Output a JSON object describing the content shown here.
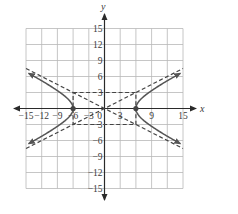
{
  "chart_data": {
    "type": "line",
    "title": "",
    "xlabel": "x",
    "ylabel": "y",
    "xlim": [
      -15,
      15
    ],
    "ylim": [
      -15,
      15
    ],
    "grid": true,
    "grid_step": 3,
    "x_tick_labels": [
      "-15",
      "-12",
      "-9",
      "-6",
      "-3",
      "0",
      "3",
      "6",
      "9",
      "15"
    ],
    "y_tick_labels": [
      "15",
      "12",
      "9",
      "6",
      "3",
      "-3",
      "-6",
      "-9",
      "-12",
      "-15"
    ],
    "equation": "x^2/36 - y^2/9 = 1",
    "series": [
      {
        "name": "hyperbola-right-branch",
        "style": "solid",
        "vertex": [
          6,
          0
        ],
        "arrows": true
      },
      {
        "name": "hyperbola-left-branch",
        "style": "solid",
        "vertex": [
          -6,
          0
        ],
        "arrows": true
      },
      {
        "name": "asymptote-positive",
        "style": "dashed",
        "equation": "y = x/2",
        "points": [
          [
            -15,
            -7.5
          ],
          [
            15,
            7.5
          ]
        ]
      },
      {
        "name": "asymptote-negative",
        "style": "dashed",
        "equation": "y = -x/2",
        "points": [
          [
            -15,
            7.5
          ],
          [
            15,
            -7.5
          ]
        ]
      },
      {
        "name": "central-rectangle",
        "style": "dashed",
        "corners": [
          [
            -6,
            3
          ],
          [
            6,
            3
          ],
          [
            6,
            -3
          ],
          [
            -6,
            -3
          ]
        ]
      }
    ],
    "points": [
      {
        "label": "vertex-left",
        "x": -6,
        "y": 0
      },
      {
        "label": "vertex-right",
        "x": 6,
        "y": 0
      }
    ]
  },
  "labels": {
    "x_axis": "x",
    "y_axis": "y",
    "x_ticks": [
      {
        "text": "−15",
        "v": -15
      },
      {
        "text": "−12",
        "v": -12
      },
      {
        "text": "−9",
        "v": -9
      },
      {
        "text": "−6",
        "v": -6
      },
      {
        "text": "−3",
        "v": -3
      },
      {
        "text": "0",
        "v": 0
      },
      {
        "text": "3",
        "v": 3
      },
      {
        "text": "9",
        "v": 9
      },
      {
        "text": "15",
        "v": 15
      }
    ],
    "y_ticks": [
      {
        "text": "15",
        "v": 15
      },
      {
        "text": "12",
        "v": 12
      },
      {
        "text": "9",
        "v": 9
      },
      {
        "text": "6",
        "v": 6
      },
      {
        "text": "3",
        "v": 3
      },
      {
        "text": "−3",
        "v": -3
      },
      {
        "text": "−6",
        "v": -6
      },
      {
        "text": "−9",
        "v": -9
      },
      {
        "text": "−12",
        "v": -12
      },
      {
        "text": "−15",
        "v": -15
      }
    ]
  },
  "colors": {
    "grid": "#b8b8b8",
    "axis": "#2a2a2a",
    "curve": "#555555",
    "dash": "#444444",
    "text": "#3a3a3a"
  }
}
